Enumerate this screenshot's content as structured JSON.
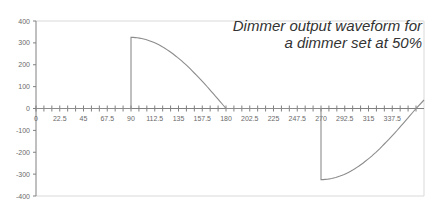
{
  "chart_data": {
    "type": "line",
    "title": "Dimmer output waveform for a dimmer set at 50%",
    "title_lines": [
      "Dimmer output waveform for",
      "a dimmer set at 50%"
    ],
    "xlabel": "",
    "ylabel": "",
    "xlim": [
      0,
      360
    ],
    "ylim": [
      -400,
      400
    ],
    "x_tick_labels": [
      "0",
      "22.5",
      "45",
      "67.5",
      "90",
      "112.5",
      "135",
      "157.5",
      "180",
      "202.5",
      "225",
      "247.5",
      "270",
      "292.5",
      "315",
      "337.5"
    ],
    "x_tick_values": [
      0,
      22.5,
      45,
      67.5,
      90,
      112.5,
      135,
      157.5,
      180,
      202.5,
      225,
      247.5,
      270,
      292.5,
      315,
      337.5
    ],
    "x_minor_tick_step": 7.5,
    "y_tick_labels": [
      "400",
      "300",
      "200",
      "100",
      "0",
      "-100",
      "-200",
      "-300",
      "-400"
    ],
    "y_tick_values": [
      400,
      300,
      200,
      100,
      0,
      -100,
      -200,
      -300,
      -400
    ],
    "grid": false,
    "legend": null,
    "series": [
      {
        "name": "Dimmer output",
        "amplitude": 325,
        "description": "Phase-cut sine wave: zero from 0-90 and 180-270 degrees; jumps to 325 at 90 and falls to 0 at 180; jumps to -325 at 270 and returns to 0 at 360",
        "x": [
          0,
          90,
          90,
          105,
          120,
          135,
          150,
          165,
          180,
          270,
          270,
          285,
          300,
          315,
          330,
          345,
          360
        ],
        "y": [
          0,
          0,
          325,
          314,
          281,
          230,
          163,
          84,
          0,
          0,
          -325,
          -314,
          -281,
          -230,
          -163,
          -84,
          0
        ]
      }
    ],
    "colors": {
      "line": "#8c8c8c",
      "axis": "#808080",
      "frame": "#d9d9d9",
      "text": "#333333"
    }
  }
}
